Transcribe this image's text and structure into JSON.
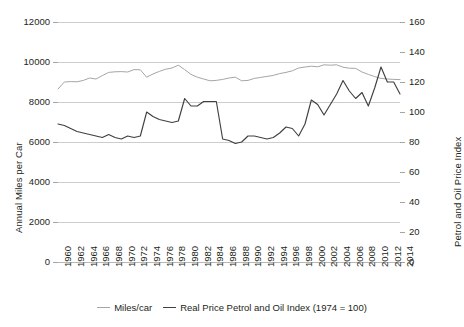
{
  "chart_data": {
    "type": "line",
    "title": "",
    "xlabel": "",
    "grid": "horizontal",
    "legend_position": "bottom-center",
    "x": [
      1960,
      1961,
      1962,
      1963,
      1964,
      1965,
      1966,
      1967,
      1968,
      1969,
      1970,
      1971,
      1972,
      1973,
      1974,
      1975,
      1976,
      1977,
      1978,
      1979,
      1980,
      1981,
      1982,
      1983,
      1984,
      1985,
      1986,
      1987,
      1988,
      1989,
      1990,
      1991,
      1992,
      1993,
      1994,
      1995,
      1996,
      1997,
      1998,
      1999,
      2000,
      2001,
      2002,
      2003,
      2004,
      2005,
      2006,
      2007,
      2008,
      2009,
      2010,
      2011,
      2012,
      2013,
      2014
    ],
    "x_tick_labels": [
      "1960",
      "1962",
      "1964",
      "1966",
      "1968",
      "1970",
      "1972",
      "1974",
      "1976",
      "1978",
      "1980",
      "1982",
      "1984",
      "1986",
      "1988",
      "1990",
      "1992",
      "1994",
      "1996",
      "1998",
      "2000",
      "2002",
      "2004",
      "2006",
      "2008",
      "2010",
      "2012",
      "2014"
    ],
    "axes": {
      "left": {
        "label": "Annual Miles per Car",
        "ticks": [
          0,
          2000,
          4000,
          6000,
          8000,
          10000,
          12000
        ],
        "tick_labels": [
          "0",
          "2000",
          "4000",
          "6000",
          "8000",
          "10000",
          "12000"
        ],
        "lim": [
          0,
          12000
        ]
      },
      "right": {
        "label": "Petrol and Oil Price Index",
        "ticks": [
          0,
          20,
          40,
          60,
          80,
          100,
          120,
          140,
          160
        ],
        "tick_labels": [
          "0",
          "20",
          "40",
          "60",
          "80",
          "100",
          "120",
          "140",
          "160"
        ],
        "lim": [
          0,
          160
        ]
      }
    },
    "series": [
      {
        "name": "Miles/car",
        "axis": "left",
        "color": "#a6a6a6",
        "values": [
          8650,
          9000,
          9020,
          9010,
          9080,
          9200,
          9150,
          9320,
          9480,
          9510,
          9520,
          9500,
          9620,
          9610,
          9240,
          9400,
          9530,
          9640,
          9700,
          9840,
          9620,
          9380,
          9240,
          9150,
          9060,
          9080,
          9130,
          9200,
          9240,
          9060,
          9080,
          9180,
          9230,
          9280,
          9330,
          9420,
          9480,
          9560,
          9700,
          9750,
          9790,
          9760,
          9860,
          9840,
          9860,
          9740,
          9690,
          9680,
          9500,
          9380,
          9270,
          9180,
          9150,
          9130,
          9120
        ]
      },
      {
        "name": "Real Price Petrol and Oil Index (1974 = 100)",
        "axis": "right",
        "color": "#404040",
        "values": [
          92,
          91,
          89,
          87,
          86,
          85,
          84,
          83,
          85,
          83,
          82,
          84,
          83,
          84,
          100,
          97,
          95,
          94,
          93,
          94,
          109,
          104,
          104,
          107,
          107,
          107,
          82,
          81,
          79,
          80,
          84,
          84,
          83,
          82,
          83,
          86,
          90,
          89,
          84,
          92,
          108,
          105,
          98,
          105,
          112,
          121,
          114,
          109,
          113,
          104,
          116,
          130,
          120,
          120,
          112
        ]
      }
    ],
    "legend": [
      {
        "label": "Miles/car",
        "color": "#a6a6a6"
      },
      {
        "label": "Real Price Petrol and Oil Index (1974 = 100)",
        "color": "#404040"
      }
    ]
  }
}
